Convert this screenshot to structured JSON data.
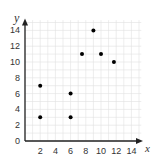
{
  "chart_data": {
    "type": "scatter",
    "title": "",
    "xlabel": "x",
    "ylabel": "y",
    "xlim": [
      0,
      15
    ],
    "ylim": [
      0,
      15
    ],
    "x_ticks": [
      2,
      4,
      6,
      8,
      10,
      12,
      14
    ],
    "y_ticks": [
      0,
      2,
      4,
      6,
      8,
      10,
      12,
      14
    ],
    "grid": true,
    "points": [
      {
        "x": 2,
        "y": 3
      },
      {
        "x": 2,
        "y": 7
      },
      {
        "x": 6,
        "y": 3
      },
      {
        "x": 6,
        "y": 6
      },
      {
        "x": 7.5,
        "y": 11
      },
      {
        "x": 9,
        "y": 14
      },
      {
        "x": 10,
        "y": 11
      },
      {
        "x": 11.7,
        "y": 10
      }
    ],
    "colors": {
      "grid": "#e0e0e0",
      "axis": "#222222",
      "point": "#000000",
      "text": "#333333"
    }
  }
}
